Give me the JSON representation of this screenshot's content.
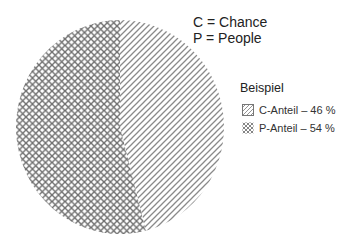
{
  "key": {
    "c_line": "C = Chance",
    "p_line": "P = People"
  },
  "legend": {
    "title": "Beispiel",
    "items": [
      {
        "label": "C-Anteil – 46 %",
        "pattern": "diagonal-hatch"
      },
      {
        "label": "P-Anteil – 54 %",
        "pattern": "cross-hatch"
      }
    ]
  },
  "colors": {
    "background": "#ffffff",
    "hatch_diagonal": "#8a8a8a",
    "hatch_cross": "#6e6e6e",
    "text": "#222222"
  },
  "chart_data": {
    "type": "pie",
    "title": "",
    "categories": [
      "C-Anteil",
      "P-Anteil"
    ],
    "values": [
      46,
      54
    ],
    "unit": "%",
    "series": [
      {
        "name": "C = Chance",
        "label": "C-Anteil – 46 %",
        "value": 46,
        "pattern": "diagonal-hatch"
      },
      {
        "name": "P = People",
        "label": "P-Anteil – 54 %",
        "value": 54,
        "pattern": "cross-hatch"
      }
    ],
    "start_angle_deg": 0,
    "direction": "clockwise",
    "legend": {
      "title": "Beispiel",
      "position": "right",
      "entries": [
        "C-Anteil – 46 %",
        "P-Anteil – 54 %"
      ]
    },
    "annotations": [
      "C = Chance",
      "P = People"
    ],
    "grid": false
  }
}
